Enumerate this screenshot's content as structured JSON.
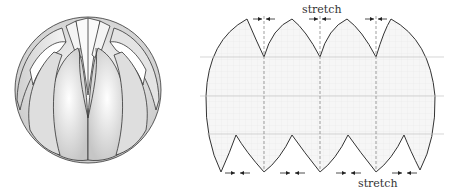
{
  "figure": {
    "left_panel": {
      "name": "folded-sphere",
      "gores": 8
    },
    "right_panel": {
      "name": "flattened-gore-pattern",
      "labels": {
        "top": "stretch",
        "bottom": "stretch"
      }
    }
  },
  "colors": {
    "stroke": "#333333",
    "fill_light": "#f2f2f2",
    "grid": "#bbbbbb",
    "shade": "#c8c8c8"
  }
}
